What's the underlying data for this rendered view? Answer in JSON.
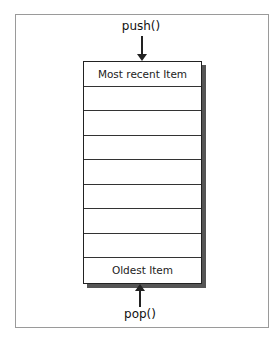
{
  "diagram": {
    "push_label": "push()",
    "pop_label": "pop()",
    "rows": [
      "Most recent Item",
      "",
      "",
      "",
      "",
      "",
      "",
      "",
      "Oldest Item"
    ]
  }
}
